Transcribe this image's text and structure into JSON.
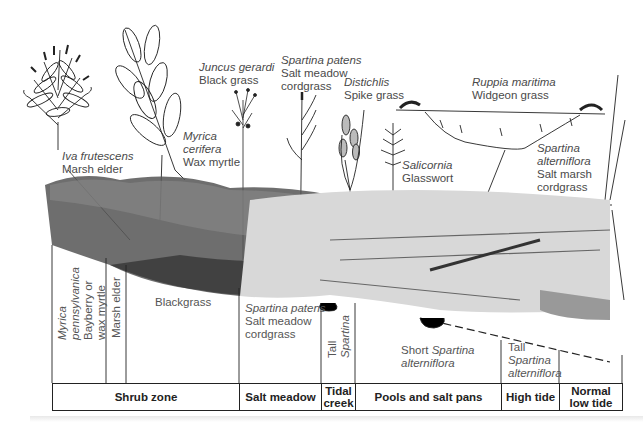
{
  "figure": {
    "type": "salt marsh cross-section illustration",
    "plant_labels": [
      {
        "scientific": "Iva frutescens",
        "common": "Marsh elder"
      },
      {
        "scientific": "Myrica cerifera",
        "common": "Wax myrtle",
        "scientific_lines": [
          "Myrica",
          "cerifera"
        ]
      },
      {
        "scientific": "Juncus gerardi",
        "common": "Black grass"
      },
      {
        "scientific": "Spartina patens",
        "common": "Salt meadow cordgrass",
        "common_lines": [
          "Salt meadow",
          "cordgrass"
        ]
      },
      {
        "scientific": "Distichlis",
        "common": "Spike grass"
      },
      {
        "scientific": "Salicornia",
        "common": "Glasswort"
      },
      {
        "scientific": "Ruppia maritima",
        "common": "Widgeon grass"
      },
      {
        "scientific": "Spartina alterniflora",
        "common": "Salt marsh cordgrass",
        "scientific_lines": [
          "Spartina",
          "alterniflora"
        ],
        "common_lines": [
          "Salt marsh",
          "cordgrass"
        ]
      }
    ],
    "vegetation_cells": {
      "myrica": {
        "sci": "Myrica",
        "sci2": "pennsylvanica",
        "common1": "Bayberry or",
        "common2": "wax myrtle"
      },
      "marsh_elder": "Marsh elder",
      "blackgrass": "Blackgrass",
      "spartina_patens": {
        "sci": "Spartina patens",
        "common1": "Salt meadow",
        "common2": "cordgrass"
      },
      "tall_spartina": {
        "line1": "Tall",
        "line2": "Spartina"
      },
      "short_spartina": {
        "prefix": "Short ",
        "sci": "Spartina",
        "sci2": "alterniflora"
      },
      "tall_spartina_alt": {
        "line1": "Tall",
        "sci": "Spartina",
        "sci2": "alterniflora"
      }
    },
    "zones": [
      {
        "label": "Shrub zone"
      },
      {
        "label": "Salt meadow"
      },
      {
        "label": "Tidal creek",
        "lines": [
          "Tidal",
          "creek"
        ]
      },
      {
        "label": "Pools and salt pans"
      },
      {
        "label": "High tide"
      },
      {
        "label": "Normal low tide",
        "lines": [
          "Normal",
          "low tide"
        ]
      }
    ],
    "colors": {
      "ink": "#222222",
      "label": "#4a4a4a",
      "background": "#ffffff"
    }
  }
}
